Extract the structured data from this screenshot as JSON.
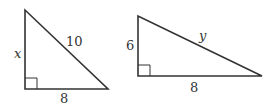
{
  "diagram": {
    "triangles": [
      {
        "id": "left",
        "vertical_leg_label": "x",
        "hypotenuse_label": "10",
        "base_label": "8",
        "right_angle": "bottom-left"
      },
      {
        "id": "right",
        "vertical_leg_label": "6",
        "hypotenuse_label": "y",
        "base_label": "8",
        "right_angle": "bottom-left"
      }
    ],
    "stroke_color": "#333333",
    "background": "#ffffff"
  }
}
